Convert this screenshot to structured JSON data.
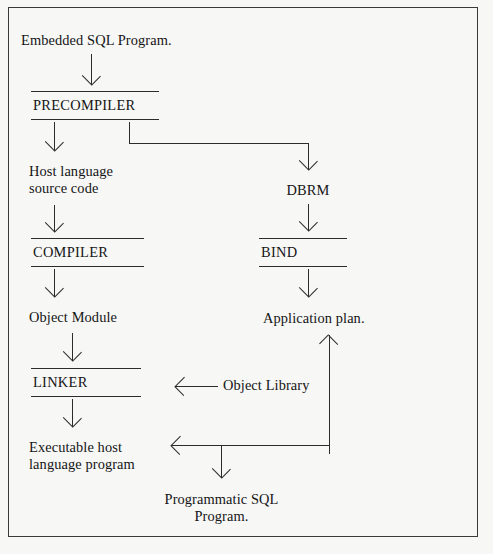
{
  "diagram": {
    "background_color": "#f7f7f5",
    "line_color": "#2c2c2c",
    "text_color": "#151515",
    "nodes": {
      "embedded_sql_program": "Embedded SQL Program.",
      "precompiler": "PRECOMPILER",
      "host_language_source": "Host language\nsource code",
      "compiler": "COMPILER",
      "object_module": "Object Module",
      "linker": "LINKER",
      "executable_host_program": "Executable host\nlanguage program",
      "dbrm": "DBRM",
      "bind": "BIND",
      "application_plan": "Application plan.",
      "object_library": "Object Library",
      "programmatic_sql_program": "Programmatic SQL\nProgram."
    }
  }
}
